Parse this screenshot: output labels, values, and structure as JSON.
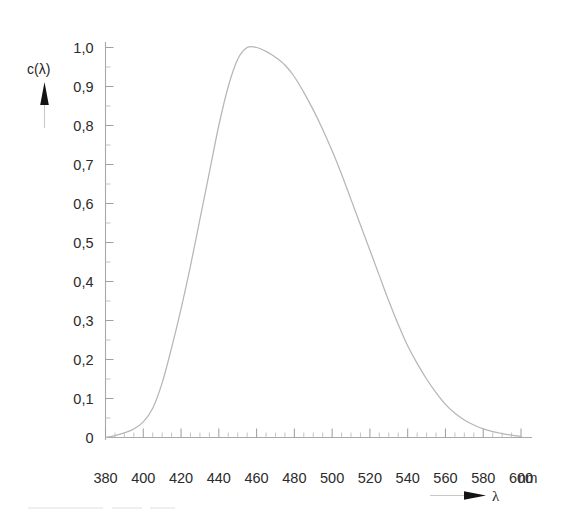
{
  "chart_data": {
    "type": "line",
    "title": "",
    "subtitle": "",
    "xlabel": "λ",
    "ylabel": "c(λ)",
    "x_unit": "nm",
    "xlim": [
      380,
      600
    ],
    "ylim": [
      0,
      1.0
    ],
    "grid": false,
    "legend": null,
    "x_major_step": 20,
    "x_minor_step": 5,
    "y_major_step": 0.1,
    "y_minor_step": 0.05,
    "x_tick_labels": [
      "380",
      "400",
      "420",
      "440",
      "460",
      "480",
      "500",
      "520",
      "540",
      "560",
      "580",
      "600"
    ],
    "x_tick_values": [
      380,
      400,
      420,
      440,
      460,
      480,
      500,
      520,
      540,
      560,
      580,
      600
    ],
    "y_tick_labels": [
      "1,0",
      "0,9",
      "0,8",
      "0,7",
      "0,6",
      "0,5",
      "0,4",
      "0,3",
      "0,2",
      "0,1",
      "0"
    ],
    "y_tick_values": [
      1.0,
      0.9,
      0.8,
      0.7,
      0.6,
      0.5,
      0.4,
      0.3,
      0.2,
      0.1,
      0
    ],
    "series": [
      {
        "name": "c(λ)",
        "color": "#b6b6b6",
        "x": [
          380,
          385,
          390,
          395,
          400,
          405,
          410,
          415,
          420,
          425,
          430,
          435,
          440,
          445,
          450,
          455,
          460,
          465,
          470,
          475,
          480,
          485,
          490,
          495,
          500,
          505,
          510,
          515,
          520,
          525,
          530,
          535,
          540,
          545,
          550,
          555,
          560,
          565,
          570,
          575,
          580,
          585,
          590,
          595,
          600
        ],
        "y": [
          0.0,
          0.005,
          0.012,
          0.022,
          0.04,
          0.075,
          0.14,
          0.23,
          0.33,
          0.44,
          0.56,
          0.68,
          0.8,
          0.9,
          0.97,
          1.0,
          1.0,
          0.99,
          0.975,
          0.955,
          0.925,
          0.885,
          0.84,
          0.79,
          0.735,
          0.675,
          0.61,
          0.545,
          0.48,
          0.415,
          0.35,
          0.29,
          0.235,
          0.19,
          0.15,
          0.115,
          0.085,
          0.062,
          0.045,
          0.032,
          0.022,
          0.015,
          0.01,
          0.006,
          0.003
        ]
      }
    ],
    "annotations": {
      "y_axis_arrow": "up-arrow",
      "x_axis_arrow": "right-arrow"
    }
  },
  "axis": {
    "y_title": "c(λ)",
    "x_title": "λ",
    "x_unit_label": "nm"
  },
  "icons": {
    "y_arrow": "arrow-up-icon",
    "x_arrow": "arrow-right-icon"
  }
}
